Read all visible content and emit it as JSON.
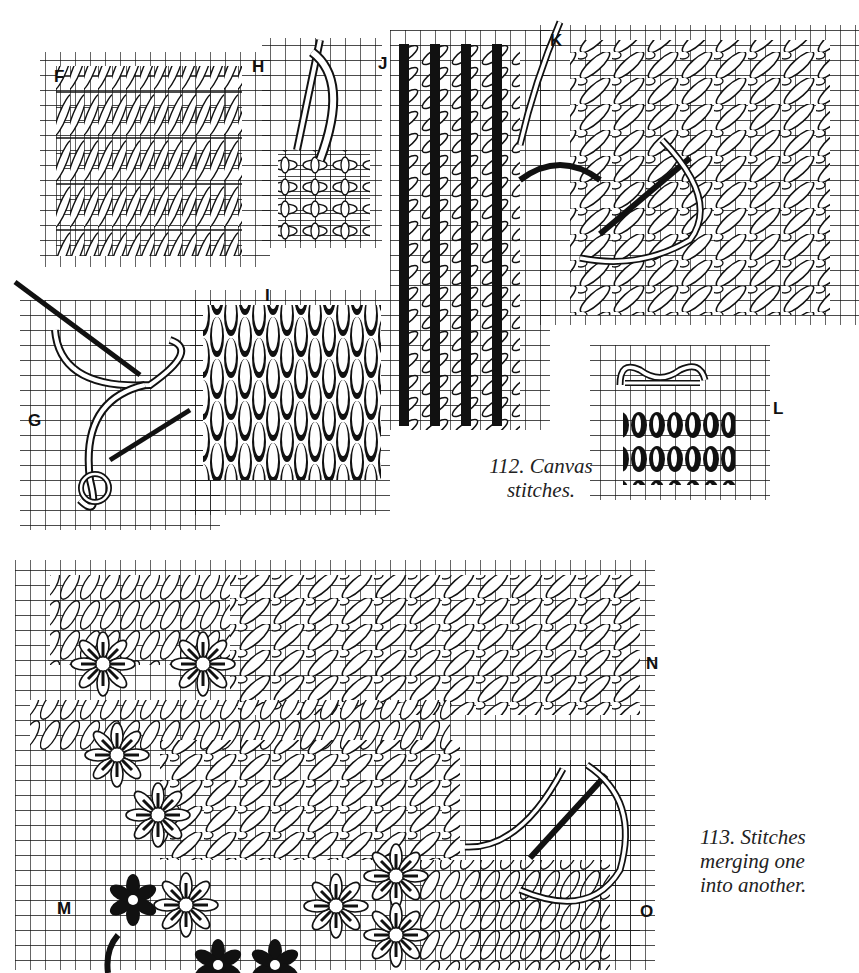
{
  "page": {
    "top_cut_text": "",
    "figures": [
      {
        "id": "112",
        "caption": "112. Canvas stitches.",
        "caption_lines": [
          "112. Canvas",
          "stitches."
        ],
        "panels": [
          {
            "label": "F",
            "description": "slanted Gobelin stitch rows"
          },
          {
            "label": "G",
            "description": "needle and threaded yarn demonstrating a knotted stitch"
          },
          {
            "label": "H",
            "description": "cross stitch with needle"
          },
          {
            "label": "I",
            "description": "upright brick stitch"
          },
          {
            "label": "J",
            "description": "knitting / herringbone columns"
          },
          {
            "label": "K",
            "description": "diagonal mosaic/Scotch stitch field with needle"
          },
          {
            "label": "L",
            "description": "rows of looped stitches with needle"
          }
        ]
      },
      {
        "id": "113",
        "caption": "113. Stitches merging one into another.",
        "caption_lines": [
          "113. Stitches",
          "merging one",
          "into another."
        ],
        "panels": [
          {
            "label": "M",
            "description": "star / rice flower stitches"
          },
          {
            "label": "N",
            "description": "diagonal stitch field"
          },
          {
            "label": "O",
            "description": "needle and yarn loop"
          }
        ]
      }
    ],
    "colors": {
      "ink": "#111111",
      "paper": "#ffffff"
    }
  }
}
